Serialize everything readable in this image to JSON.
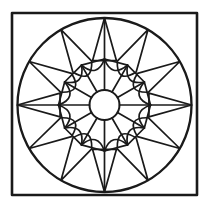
{
  "document": {
    "title": "Geometric Mandala Coloring Page",
    "kind": "line-art-illustration",
    "background_color": "#ffffff",
    "ink_color": "#1a1a1a",
    "canvas": {
      "width": 210,
      "height": 213
    }
  },
  "artwork": {
    "name": "rosette-mandala",
    "description": "Square frame enclosing a circular twelve-fold rosette with a central disc, twelve radiating spokes, an inscribed twelve-sided polygon, petal and triangle motifs.",
    "symmetry_order": 12,
    "frame": {
      "name": "square-frame",
      "x": 12,
      "y": 13,
      "width": 185,
      "height": 182,
      "stroke_width": 2.6
    },
    "outer_circle": {
      "name": "outer-circle",
      "cx": 104.5,
      "cy": 105,
      "r": 87,
      "stroke_width": 2.3
    },
    "center_circle": {
      "name": "center-circle",
      "cx": 104.5,
      "cy": 105,
      "r": 15,
      "stroke_width": 2.0
    },
    "inner_polygon": {
      "name": "inner-dodecagon",
      "sides": 12,
      "circumradius": 46,
      "rotation_deg": 0
    },
    "spokes": {
      "name": "radial-spokes",
      "count": 12,
      "inner_radius": 15,
      "outer_radius": 46,
      "angles_deg": [
        0,
        30,
        60,
        90,
        120,
        150,
        180,
        210,
        240,
        270,
        300,
        330
      ]
    },
    "outer_ring": {
      "name": "outer-ring-motifs",
      "node_radius": 87,
      "motif_cycle": [
        "triangle",
        "petal",
        "petal"
      ],
      "petal_count": 8,
      "triangle_count": 4,
      "triangle_angles_deg": [
        0,
        90,
        180,
        270
      ],
      "petal_angles_deg": [
        30,
        60,
        120,
        150,
        210,
        240,
        300,
        330
      ]
    },
    "ring_arcs": {
      "name": "concave-ring-arcs",
      "count": 12,
      "sweep": "concave-inward"
    }
  },
  "palette": {
    "paper": "#ffffff",
    "line": "#1a1a1a"
  }
}
